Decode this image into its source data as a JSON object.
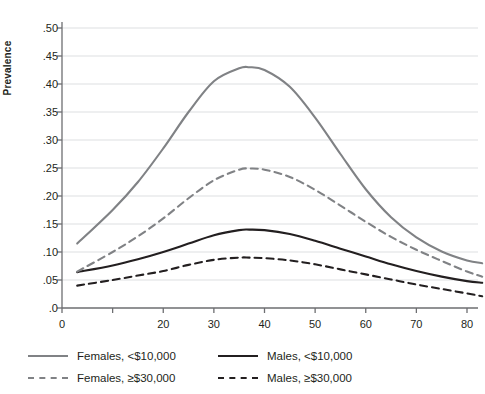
{
  "chart_data": {
    "type": "line",
    "title": "",
    "xlabel": "",
    "ylabel": "Prevalence",
    "xlim": [
      0,
      83
    ],
    "ylim": [
      0,
      0.5
    ],
    "grid": true,
    "legend_position": "below",
    "y_ticks": [
      ".0",
      ".05",
      ".10",
      ".15",
      ".20",
      ".25",
      ".30",
      ".35",
      ".40",
      ".45",
      ".50"
    ],
    "y_tick_values": [
      0,
      0.05,
      0.1,
      0.15,
      0.2,
      0.25,
      0.3,
      0.35,
      0.4,
      0.45,
      0.5
    ],
    "x_ticks": [
      "0",
      "",
      "20",
      "30",
      "40",
      "50",
      "60",
      "70",
      "80"
    ],
    "x_tick_values": [
      0,
      10,
      20,
      30,
      40,
      50,
      60,
      70,
      80
    ],
    "x": [
      3,
      10,
      15,
      20,
      25,
      30,
      35,
      37,
      40,
      45,
      50,
      55,
      60,
      65,
      70,
      75,
      80,
      83
    ],
    "series": [
      {
        "name": "Females, <$10,000",
        "color": "#808285",
        "style": "solid",
        "width": 2.1,
        "values": [
          0.115,
          0.175,
          0.225,
          0.285,
          0.35,
          0.405,
          0.428,
          0.43,
          0.425,
          0.395,
          0.34,
          0.275,
          0.212,
          0.162,
          0.126,
          0.101,
          0.085,
          0.08
        ]
      },
      {
        "name": "Males, <$10,000",
        "color": "#231f20",
        "style": "solid",
        "width": 2.1,
        "values": [
          0.064,
          0.076,
          0.087,
          0.1,
          0.115,
          0.13,
          0.139,
          0.14,
          0.139,
          0.132,
          0.12,
          0.106,
          0.092,
          0.078,
          0.066,
          0.056,
          0.048,
          0.045
        ]
      },
      {
        "name": "Females, ≥$30,000",
        "color": "#808285",
        "style": "dashed",
        "width": 2.1,
        "values": [
          0.065,
          0.1,
          0.128,
          0.16,
          0.196,
          0.228,
          0.247,
          0.249,
          0.247,
          0.234,
          0.211,
          0.183,
          0.154,
          0.127,
          0.104,
          0.084,
          0.065,
          0.056
        ]
      },
      {
        "name": "Males, ≥$30,000",
        "color": "#231f20",
        "style": "dashed",
        "width": 2.1,
        "values": [
          0.04,
          0.05,
          0.058,
          0.066,
          0.077,
          0.086,
          0.09,
          0.09,
          0.089,
          0.085,
          0.078,
          0.069,
          0.06,
          0.051,
          0.042,
          0.034,
          0.026,
          0.021
        ]
      }
    ]
  },
  "legend": {
    "items": [
      {
        "label": "Females, <$10,000",
        "color": "#808285",
        "style": "solid"
      },
      {
        "label": "Males, <$10,000",
        "color": "#231f20",
        "style": "solid"
      },
      {
        "label": "Females, ≥$30,000",
        "color": "#808285",
        "style": "dashed"
      },
      {
        "label": "Males, ≥$30,000",
        "color": "#231f20",
        "style": "dashed"
      }
    ]
  },
  "axes": {
    "y_title": "Prevalence"
  },
  "colors": {
    "grid": "#e9eaeb",
    "axis": "#6d6e71",
    "text": "#231f20",
    "female": "#808285",
    "male": "#231f20"
  }
}
